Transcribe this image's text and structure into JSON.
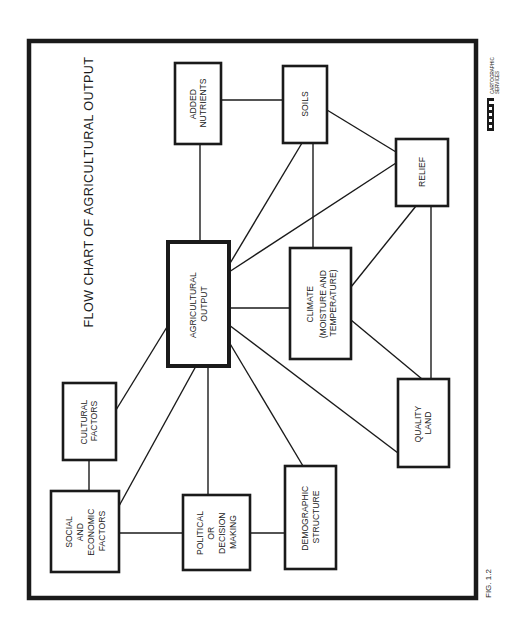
{
  "figure": {
    "title": "FLOW CHART OF AGRICULTURAL OUTPUT",
    "caption": "FIG. 1.2",
    "orientation": "rotated 90° counter-clockwise (text reads bottom-to-top)",
    "logo": {
      "mark": "UWM",
      "line1": "CARTOGRAPHIC",
      "line2": "SERVICES"
    },
    "colors": {
      "ink": "#1a1a1a",
      "background": "#ffffff"
    }
  },
  "nodes": {
    "agricultural_output": {
      "lines": [
        "AGRICULTURAL",
        "OUTPUT"
      ],
      "emphasis": "thick-border"
    },
    "added_nutrients": {
      "lines": [
        "ADDED",
        "NUTRIENTS"
      ]
    },
    "soils": {
      "lines": [
        "SOILS"
      ]
    },
    "relief": {
      "lines": [
        "RELIEF"
      ]
    },
    "climate": {
      "lines": [
        "CLIMATE",
        "(MOISTURE AND",
        "TEMPERATURE)"
      ]
    },
    "quality_land": {
      "lines": [
        "QUALITY",
        "LAND"
      ]
    },
    "demographic_structure": {
      "lines": [
        "DEMOGRAPHIC",
        "STRUCTURE"
      ]
    },
    "political": {
      "lines": [
        "POLITICAL",
        "OR",
        "DECISION",
        "MAKING"
      ]
    },
    "social_economic": {
      "lines": [
        "SOCIAL",
        "AND",
        "ECONOMIC",
        "FACTORS"
      ]
    },
    "cultural_factors": {
      "lines": [
        "CULTURAL",
        "FACTORS"
      ]
    }
  },
  "edges": [
    [
      "added_nutrients",
      "soils"
    ],
    [
      "added_nutrients",
      "agricultural_output"
    ],
    [
      "soils",
      "agricultural_output"
    ],
    [
      "soils",
      "climate"
    ],
    [
      "soils",
      "relief"
    ],
    [
      "relief",
      "agricultural_output"
    ],
    [
      "relief",
      "climate"
    ],
    [
      "relief",
      "quality_land"
    ],
    [
      "climate",
      "agricultural_output"
    ],
    [
      "climate",
      "quality_land"
    ],
    [
      "quality_land",
      "agricultural_output"
    ],
    [
      "demographic_structure",
      "agricultural_output"
    ],
    [
      "political",
      "agricultural_output"
    ],
    [
      "political",
      "demographic_structure"
    ],
    [
      "social_economic",
      "political"
    ],
    [
      "social_economic",
      "agricultural_output"
    ],
    [
      "social_economic",
      "cultural_factors"
    ],
    [
      "cultural_factors",
      "agricultural_output"
    ]
  ]
}
